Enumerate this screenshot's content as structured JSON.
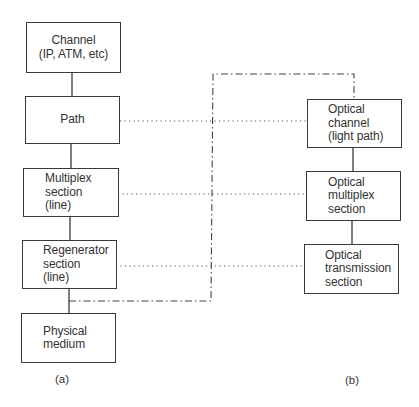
{
  "diagram": {
    "left_stack": {
      "caption": "(a)",
      "boxes": [
        {
          "id": "channel",
          "lines": [
            "Channel",
            "(IP, ATM, etc)"
          ]
        },
        {
          "id": "path",
          "lines": [
            "Path"
          ]
        },
        {
          "id": "multiplex-section",
          "lines": [
            "Multiplex",
            "section",
            "(line)"
          ]
        },
        {
          "id": "regenerator-section",
          "lines": [
            "Regenerator",
            "section",
            "(line)"
          ]
        },
        {
          "id": "physical-medium",
          "lines": [
            "Physical",
            "medium"
          ]
        }
      ]
    },
    "right_stack": {
      "caption": "(b)",
      "boxes": [
        {
          "id": "optical-channel",
          "lines": [
            "Optical",
            "channel",
            "(light path)"
          ]
        },
        {
          "id": "optical-multiplex-section",
          "lines": [
            "Optical",
            "multiplex",
            "section"
          ]
        },
        {
          "id": "optical-transmission-section",
          "lines": [
            "Optical",
            "transmission",
            "section"
          ]
        }
      ]
    },
    "mappings": [
      {
        "from": "path",
        "to": "optical-channel",
        "style": "dotted"
      },
      {
        "from": "multiplex-section",
        "to": "optical-multiplex-section",
        "style": "dotted"
      },
      {
        "from": "regenerator-section",
        "to": "optical-transmission-section",
        "style": "dotted"
      },
      {
        "from": "regenerator-physical-link",
        "to": "optical-channel",
        "style": "dash-dot"
      }
    ],
    "colors": {
      "line": "#3a3a3a",
      "text": "#333333",
      "background": "#ffffff"
    }
  }
}
